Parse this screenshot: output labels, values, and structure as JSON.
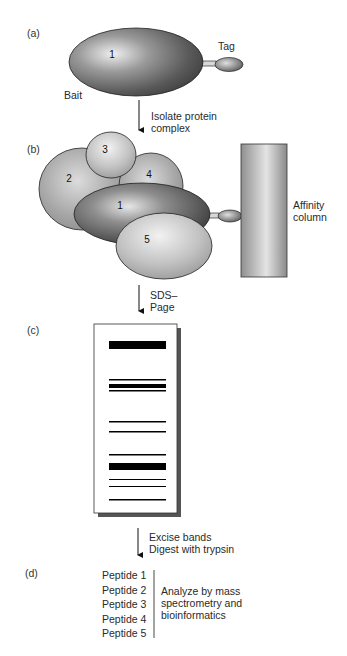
{
  "panels": {
    "a": {
      "label": "(a)",
      "bait_number": "1",
      "bait_label": "Bait",
      "tag_label": "Tag"
    },
    "step1": {
      "line1": "Isolate protein",
      "line2": "complex"
    },
    "b": {
      "label": "(b)",
      "proteins": [
        "1",
        "2",
        "3",
        "4",
        "5"
      ],
      "column_label_line1": "Affinity",
      "column_label_line2": "column"
    },
    "step2": {
      "line1": "SDS–",
      "line2": "Page"
    },
    "c": {
      "label": "(c)",
      "gel_bands": [
        {
          "y": 341,
          "h": 8,
          "weight": "thick"
        },
        {
          "y": 379,
          "h": 1.5,
          "weight": "thin"
        },
        {
          "y": 384,
          "h": 4,
          "weight": "thick"
        },
        {
          "y": 390,
          "h": 1.5,
          "weight": "thin"
        },
        {
          "y": 421,
          "h": 1.5,
          "weight": "thin"
        },
        {
          "y": 431,
          "h": 1.5,
          "weight": "thin"
        },
        {
          "y": 454,
          "h": 1.5,
          "weight": "thin"
        },
        {
          "y": 463,
          "h": 7,
          "weight": "thick"
        },
        {
          "y": 479,
          "h": 1,
          "weight": "thin"
        },
        {
          "y": 486,
          "h": 1,
          "weight": "thin"
        },
        {
          "y": 499,
          "h": 1.5,
          "weight": "thin"
        }
      ]
    },
    "step3": {
      "line1": "Excise bands",
      "line2": "Digest with trypsin"
    },
    "d": {
      "label": "(d)",
      "peptides": [
        "Peptide 1",
        "Peptide 2",
        "Peptide 3",
        "Peptide 4",
        "Peptide 5"
      ],
      "analysis_line1": "Analyze by mass",
      "analysis_line2": "spectrometry and",
      "analysis_line3": "bioinformatics"
    }
  }
}
